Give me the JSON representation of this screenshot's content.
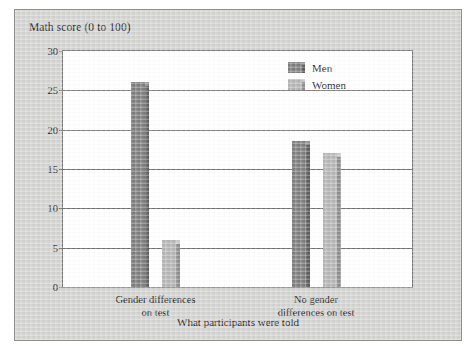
{
  "chart_data": {
    "type": "bar",
    "title": "",
    "ylabel": "Math score (0 to 100)",
    "xlabel": "What participants were told",
    "categories": [
      "Gender differences\non test",
      "No gender\ndifferences on test"
    ],
    "categories_lines": [
      [
        "Gender differences",
        "on test"
      ],
      [
        "No gender",
        "differences on test"
      ]
    ],
    "series": [
      {
        "name": "Men",
        "values": [
          26,
          18.5
        ],
        "color": "#7d7d7d"
      },
      {
        "name": "Women",
        "values": [
          6,
          17
        ],
        "color": "#b5b5b5"
      }
    ],
    "ylim": [
      0,
      30
    ],
    "yticks": [
      0,
      5,
      10,
      15,
      20,
      25,
      30
    ],
    "ytick_labels": [
      "0",
      "5",
      "10",
      "15",
      "20",
      "25",
      "30"
    ],
    "grid": true,
    "legend_position": "top-right-inside"
  },
  "legend": {
    "entries": [
      {
        "label": "Men"
      },
      {
        "label": "Women"
      }
    ]
  },
  "colors": {
    "men": "#7d7d7d",
    "women": "#b5b5b5",
    "men_shadow": "#5d5d5d",
    "women_shadow": "#8f8f8f",
    "axis": "#6f6f6f",
    "panel_background": "#d2d2d0",
    "plot_background": "#ffffff",
    "text": "#1b1b1b"
  }
}
